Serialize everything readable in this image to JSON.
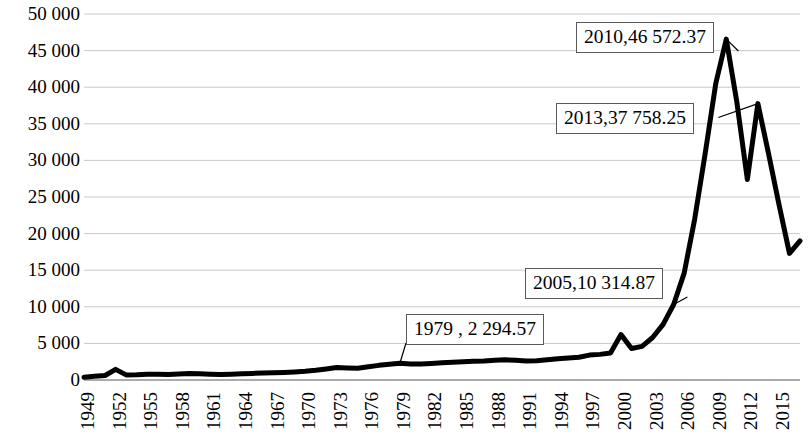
{
  "chart_data": {
    "type": "line",
    "title": "",
    "subtitle": "",
    "xlabel": "",
    "ylabel": "",
    "grid": true,
    "legend": false,
    "legend_position": "none",
    "xlim": [
      1949,
      2017
    ],
    "ylim": [
      0,
      50000
    ],
    "ytick_labels": [
      "50 000",
      "45 000",
      "40 000",
      "35 000",
      "30 000",
      "25 000",
      "20 000",
      "15 000",
      "10 000",
      "5 000",
      "0"
    ],
    "ytick_values": [
      50000,
      45000,
      40000,
      35000,
      30000,
      25000,
      20000,
      15000,
      10000,
      5000,
      0
    ],
    "xtick_labels": [
      "1949",
      "1952",
      "1955",
      "1958",
      "1961",
      "1964",
      "1967",
      "1970",
      "1973",
      "1976",
      "1979",
      "1982",
      "1985",
      "1988",
      "1991",
      "1994",
      "1997",
      "2000",
      "2003",
      "2006",
      "2009",
      "2012",
      "2015"
    ],
    "xtick_values": [
      1949,
      1952,
      1955,
      1958,
      1961,
      1964,
      1967,
      1970,
      1973,
      1976,
      1979,
      1982,
      1985,
      1988,
      1991,
      1994,
      1997,
      2000,
      2003,
      2006,
      2009,
      2012,
      2015
    ],
    "line_color": "#000000",
    "line_width": 5,
    "x": [
      1949,
      1950,
      1951,
      1952,
      1953,
      1954,
      1955,
      1956,
      1957,
      1958,
      1959,
      1960,
      1961,
      1962,
      1963,
      1964,
      1965,
      1966,
      1967,
      1968,
      1969,
      1970,
      1971,
      1972,
      1973,
      1974,
      1975,
      1976,
      1977,
      1978,
      1979,
      1980,
      1981,
      1982,
      1983,
      1984,
      1985,
      1986,
      1987,
      1988,
      1989,
      1990,
      1991,
      1992,
      1993,
      1994,
      1995,
      1996,
      1997,
      1998,
      1999,
      2000,
      2001,
      2002,
      2003,
      2004,
      2005,
      2006,
      2007,
      2008,
      2009,
      2010,
      2011,
      2012,
      2013,
      2014,
      2015,
      2016,
      2017
    ],
    "values": [
      380,
      500,
      620,
      1450,
      700,
      720,
      780,
      800,
      760,
      820,
      900,
      860,
      800,
      760,
      800,
      860,
      900,
      960,
      1000,
      1040,
      1100,
      1180,
      1320,
      1500,
      1700,
      1650,
      1600,
      1820,
      2000,
      2140,
      2294.57,
      2200,
      2180,
      2260,
      2340,
      2420,
      2500,
      2560,
      2600,
      2700,
      2760,
      2700,
      2600,
      2640,
      2760,
      2900,
      3000,
      3100,
      3400,
      3500,
      3700,
      6200,
      4300,
      4600,
      5800,
      7600,
      10314.87,
      14600,
      22000,
      31000,
      40500,
      46572.37,
      38000,
      27400,
      37758.25,
      31000,
      24000,
      17300,
      19000
    ],
    "annotations": [
      {
        "label": "2010,46 572.37",
        "year": 2010,
        "value": 46572.37
      },
      {
        "label": "2013,37 758.25",
        "year": 2013,
        "value": 37758.25
      },
      {
        "label": "2005,10 314.87",
        "year": 2005,
        "value": 10314.87
      },
      {
        "label": "1979 , 2 294.57",
        "year": 1979,
        "value": 2294.57
      }
    ]
  }
}
